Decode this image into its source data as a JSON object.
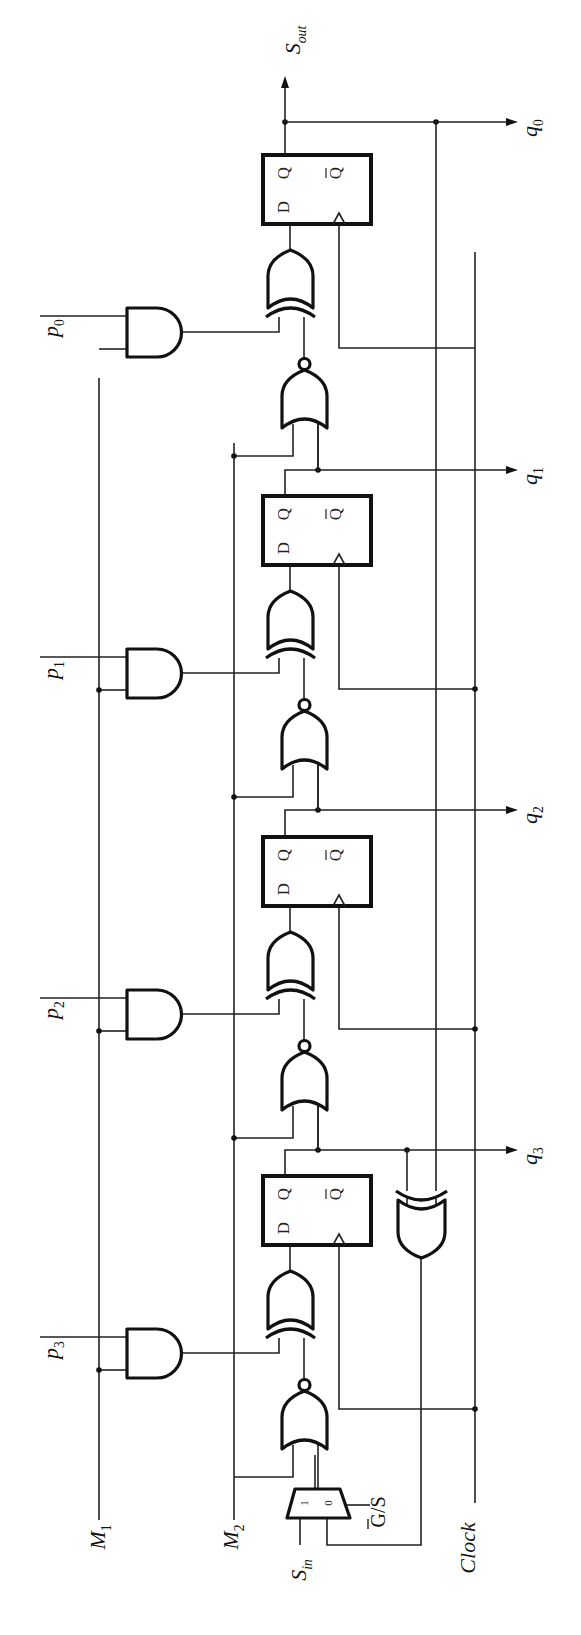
{
  "diagram": {
    "orientation": "rotated -90deg (page reads bottom-to-top)",
    "colors": {
      "ink": "#111111",
      "background": "#ffffff"
    }
  },
  "labels": {
    "s_out": {
      "main": "S",
      "sub": "out"
    },
    "s_in": {
      "main": "S",
      "sub": "in"
    },
    "m1": {
      "main": "M",
      "sub": "1"
    },
    "m2": {
      "main": "M",
      "sub": "2"
    },
    "clock": "Clock",
    "gs": "G/S",
    "p": [
      {
        "main": "p",
        "sub": "0"
      },
      {
        "main": "p",
        "sub": "1"
      },
      {
        "main": "p",
        "sub": "2"
      },
      {
        "main": "p",
        "sub": "3"
      }
    ],
    "q": [
      {
        "main": "q",
        "sub": "0"
      },
      {
        "main": "q",
        "sub": "1"
      },
      {
        "main": "q",
        "sub": "2"
      },
      {
        "main": "q",
        "sub": "3"
      }
    ]
  },
  "flipflop": {
    "d": "D",
    "q": "Q",
    "qbar": "Q"
  },
  "mux": {
    "in1": "1",
    "in0": "0"
  },
  "stages": [
    {
      "index": 0,
      "ff_y": 155,
      "and_y": 308,
      "xor_y": 235,
      "nor_y": 360,
      "clk_y": 252,
      "q_y": 122
    },
    {
      "index": 1,
      "ff_y": 496,
      "and_y": 649,
      "xor_y": 576,
      "nor_y": 701,
      "clk_y": 593,
      "q_y": 470
    },
    {
      "index": 2,
      "ff_y": 837,
      "and_y": 990,
      "xor_y": 917,
      "nor_y": 1042,
      "clk_y": 933,
      "q_y": 810
    },
    {
      "index": 3,
      "ff_y": 1176,
      "and_y": 1329,
      "xor_y": 1256,
      "nor_y": 1381,
      "clk_y": 1313,
      "q_y": 1150
    }
  ]
}
